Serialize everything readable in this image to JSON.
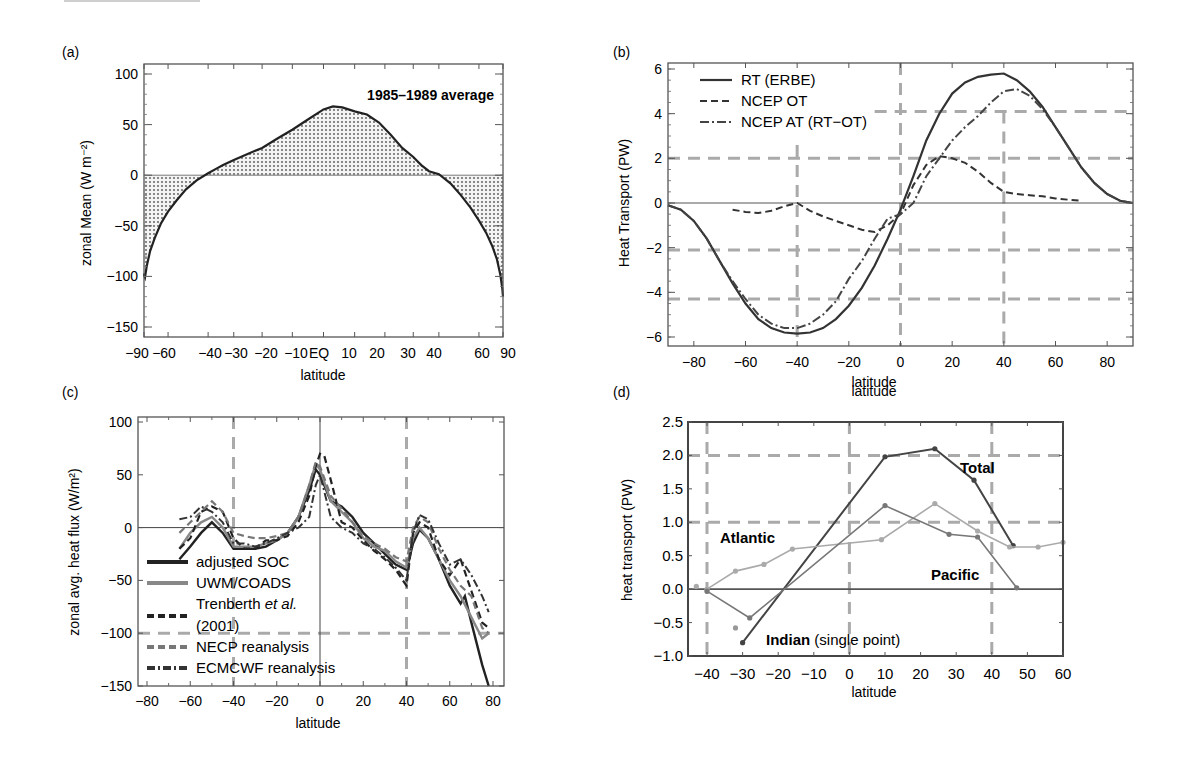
{
  "figure": {
    "panels": [
      "(a)",
      "(b)",
      "(c)",
      "(d)"
    ]
  },
  "chart_data": [
    {
      "id": "a",
      "panel_label": "(a)",
      "type": "area",
      "title": "",
      "annotation": "1985–1989 average",
      "xlabel": "latitude",
      "ylabel": "zonal Mean (W m⁻²)",
      "xlim": [
        -90,
        90
      ],
      "ylim": [
        -150,
        100
      ],
      "xticks": [
        "-90",
        "-60",
        "-40",
        "-30",
        "-20",
        "-10",
        "EQ",
        "10",
        "20",
        "30",
        "40",
        "60",
        "90"
      ],
      "yticks": [
        "100",
        "50",
        "0",
        "-50",
        "-100",
        "-150"
      ],
      "grid": false,
      "fill": "stippled",
      "series": [
        {
          "name": "zonal mean net radiation",
          "x": [
            -90,
            -87,
            -84,
            -80,
            -75,
            -70,
            -65,
            -60,
            -55,
            -50,
            -45,
            -40,
            -37,
            -34,
            -30,
            -25,
            -20,
            -15,
            -10,
            -5,
            0,
            3,
            6,
            10,
            14,
            18,
            22,
            26,
            30,
            33,
            36,
            40,
            45,
            50,
            55,
            60,
            65,
            70,
            75,
            80,
            85,
            90
          ],
          "y": [
            -97,
            -99,
            -101,
            -90,
            -75,
            -62,
            -48,
            -36,
            -25,
            -14,
            -5,
            2,
            6,
            10,
            15,
            21,
            27,
            36,
            45,
            55,
            65,
            68,
            67,
            63,
            60,
            52,
            40,
            27,
            18,
            10,
            4,
            1,
            -8,
            -20,
            -32,
            -45,
            -57,
            -70,
            -83,
            -98,
            -112,
            -120
          ]
        }
      ]
    },
    {
      "id": "b",
      "panel_label": "(b)",
      "type": "line",
      "xlabel": "latitude",
      "ylabel": "Heat Transport (PW)",
      "xlim": [
        -90,
        90
      ],
      "ylim": [
        -6,
        6
      ],
      "xticks": [
        "-80",
        "-60",
        "-40",
        "-20",
        "0",
        "20",
        "40",
        "60",
        "80"
      ],
      "yticks": [
        "6",
        "4",
        "2",
        "0",
        "-2",
        "-4",
        "-6"
      ],
      "grid": "dashed reference lines at y=±2, ±4.2, x=-40, 0, 40",
      "legend_position": "upper left",
      "legend": [
        "RT (ERBE)",
        "NCEP OT",
        "NCEP AT (RT−OT)"
      ],
      "series": [
        {
          "name": "RT (ERBE)",
          "style": "solid",
          "x": [
            -90,
            -85,
            -80,
            -75,
            -70,
            -65,
            -60,
            -55,
            -50,
            -45,
            -40,
            -35,
            -30,
            -25,
            -20,
            -15,
            -10,
            -5,
            0,
            5,
            10,
            15,
            20,
            25,
            30,
            35,
            40,
            45,
            50,
            55,
            60,
            65,
            70,
            75,
            80,
            85,
            90
          ],
          "y": [
            -0.1,
            -0.3,
            -0.8,
            -1.6,
            -2.6,
            -3.6,
            -4.5,
            -5.2,
            -5.6,
            -5.8,
            -5.85,
            -5.8,
            -5.6,
            -5.2,
            -4.6,
            -3.8,
            -2.8,
            -1.6,
            -0.3,
            1.2,
            2.8,
            4.0,
            4.9,
            5.4,
            5.65,
            5.75,
            5.8,
            5.5,
            5.0,
            4.3,
            3.4,
            2.5,
            1.6,
            0.9,
            0.4,
            0.1,
            0.0
          ]
        },
        {
          "name": "NCEP OT",
          "style": "dashed",
          "x": [
            -65,
            -60,
            -55,
            -50,
            -45,
            -40,
            -35,
            -30,
            -25,
            -20,
            -15,
            -10,
            -5,
            0,
            5,
            10,
            15,
            20,
            25,
            30,
            35,
            40,
            45,
            50,
            55,
            60,
            65,
            70
          ],
          "y": [
            -0.3,
            -0.4,
            -0.45,
            -0.35,
            -0.15,
            0.0,
            -0.35,
            -0.6,
            -0.8,
            -1.0,
            -1.2,
            -1.3,
            -1.0,
            -0.5,
            0.8,
            1.7,
            2.1,
            2.0,
            1.8,
            1.4,
            0.9,
            0.5,
            0.4,
            0.35,
            0.3,
            0.2,
            0.15,
            0.1
          ]
        },
        {
          "name": "NCEP AT (RT−OT)",
          "style": "dash-dot",
          "x": [
            -90,
            -85,
            -80,
            -75,
            -70,
            -65,
            -60,
            -55,
            -50,
            -45,
            -40,
            -35,
            -30,
            -25,
            -20,
            -15,
            -10,
            -5,
            0,
            5,
            10,
            15,
            20,
            25,
            30,
            35,
            40,
            45,
            50,
            55,
            60,
            65,
            70,
            75,
            80,
            85,
            90
          ],
          "y": [
            -0.1,
            -0.3,
            -0.8,
            -1.6,
            -2.6,
            -3.5,
            -4.3,
            -5.0,
            -5.4,
            -5.6,
            -5.6,
            -5.4,
            -5.0,
            -4.4,
            -3.4,
            -2.6,
            -1.6,
            -0.7,
            -0.5,
            0.0,
            1.2,
            2.0,
            2.8,
            3.4,
            3.9,
            4.5,
            5.0,
            5.1,
            4.8,
            4.2,
            3.4,
            2.5,
            1.6,
            0.9,
            0.4,
            0.1,
            0.0
          ]
        }
      ]
    },
    {
      "id": "c",
      "panel_label": "(c)",
      "type": "line",
      "xlabel": "latitude",
      "ylabel": "zonal avg. heat flux (W/m²)",
      "xlim": [
        -85,
        85
      ],
      "ylim": [
        -150,
        100
      ],
      "xticks": [
        "-80",
        "-60",
        "-40",
        "-20",
        "0",
        "20",
        "40",
        "60",
        "80"
      ],
      "yticks": [
        "100",
        "50",
        "0",
        "-50",
        "-100",
        "-150"
      ],
      "grid": "dashed reference lines at x=-40, 40 and y=-100; solid at x=0, y=0",
      "legend_position": "lower left",
      "legend": [
        "adjusted SOC",
        "UWM/COADS",
        "Trenberth et al. (2001)",
        "NECP reanalysis",
        "ECMCWF reanalysis"
      ],
      "series": [
        {
          "name": "adjusted SOC",
          "style": "solid black",
          "x": [
            -65,
            -60,
            -55,
            -50,
            -45,
            -40,
            -35,
            -30,
            -25,
            -20,
            -15,
            -10,
            -5,
            -2,
            0,
            5,
            10,
            15,
            20,
            25,
            30,
            35,
            40,
            43,
            46,
            50,
            55,
            60,
            65,
            67,
            70,
            75,
            78
          ],
          "y": [
            -30,
            -18,
            -5,
            5,
            -5,
            -20,
            -20,
            -20,
            -18,
            -12,
            -5,
            10,
            35,
            55,
            50,
            25,
            20,
            10,
            -5,
            -15,
            -25,
            -35,
            -40,
            -15,
            -2,
            -10,
            -30,
            -55,
            -72,
            -65,
            -90,
            -130,
            -150
          ]
        },
        {
          "name": "UWM/COADS",
          "style": "solid gray",
          "x": [
            -65,
            -60,
            -55,
            -50,
            -45,
            -40,
            -35,
            -30,
            -25,
            -20,
            -15,
            -10,
            -5,
            -2,
            0,
            5,
            10,
            15,
            20,
            25,
            30,
            35,
            40,
            43,
            46,
            50,
            55,
            60,
            65,
            70,
            75,
            78
          ],
          "y": [
            -20,
            -5,
            5,
            10,
            0,
            -18,
            -18,
            -18,
            -15,
            -12,
            -5,
            10,
            40,
            60,
            55,
            25,
            15,
            5,
            -10,
            -18,
            -22,
            -32,
            -38,
            -10,
            0,
            -10,
            -30,
            -50,
            -65,
            -85,
            -105,
            -100
          ]
        },
        {
          "name": "Trenberth et al. (2001)",
          "style": "dashed black",
          "x": [
            -65,
            -60,
            -55,
            -50,
            -45,
            -40,
            -35,
            -30,
            -25,
            -20,
            -15,
            -10,
            -5,
            -2,
            0,
            2,
            5,
            10,
            15,
            20,
            25,
            30,
            35,
            40,
            43,
            46,
            50,
            55,
            60,
            65,
            70,
            75,
            78
          ],
          "y": [
            -20,
            -10,
            15,
            20,
            15,
            -10,
            -20,
            -20,
            -12,
            -12,
            -8,
            5,
            30,
            58,
            70,
            68,
            45,
            5,
            0,
            -12,
            -22,
            -30,
            -40,
            -55,
            -5,
            5,
            0,
            -30,
            -45,
            -30,
            -60,
            -90,
            -95
          ]
        },
        {
          "name": "NECP reanalysis",
          "style": "dashed gray",
          "x": [
            -65,
            -60,
            -55,
            -50,
            -45,
            -40,
            -35,
            -30,
            -25,
            -20,
            -15,
            -10,
            -5,
            -2,
            0,
            5,
            10,
            15,
            20,
            25,
            30,
            35,
            40,
            43,
            46,
            50,
            55,
            60,
            65,
            70,
            75,
            78
          ],
          "y": [
            -5,
            5,
            15,
            25,
            15,
            -5,
            -8,
            -10,
            -10,
            -8,
            -5,
            10,
            40,
            62,
            58,
            30,
            18,
            5,
            -8,
            -15,
            -20,
            -28,
            -32,
            0,
            10,
            5,
            -20,
            -40,
            -55,
            -65,
            -95,
            -100
          ]
        },
        {
          "name": "ECMCWF reanalysis",
          "style": "dash-dot black",
          "x": [
            -65,
            -60,
            -55,
            -50,
            -45,
            -40,
            -35,
            -30,
            -25,
            -20,
            -15,
            -10,
            -5,
            -2,
            0,
            5,
            10,
            15,
            20,
            25,
            30,
            35,
            40,
            43,
            46,
            50,
            55,
            60,
            65,
            70,
            75,
            78
          ],
          "y": [
            8,
            10,
            20,
            15,
            5,
            -15,
            -15,
            -18,
            -15,
            -10,
            -5,
            0,
            10,
            40,
            50,
            10,
            0,
            -5,
            -15,
            -20,
            -28,
            -38,
            -50,
            -5,
            12,
            8,
            -15,
            -35,
            -30,
            -45,
            -65,
            -80
          ]
        }
      ]
    },
    {
      "id": "d",
      "panel_label": "(d)",
      "type": "line",
      "xlabel": "latitude",
      "top_label": "latitude",
      "ylabel": "heat transport (PW)",
      "xlim": [
        -45,
        60
      ],
      "ylim": [
        -1.0,
        2.5
      ],
      "xticks": [
        "-40",
        "-30",
        "-20",
        "-10",
        "0",
        "10",
        "20",
        "30",
        "40",
        "50",
        "60"
      ],
      "yticks": [
        "2.5",
        "2.0",
        "1.5",
        "1.0",
        "0.5",
        "0.0",
        "-0.5",
        "-1.0"
      ],
      "grid": "dashed reference lines at x=-40, 0, 40 and y=1.0, 2.0",
      "annotations": [
        "Total",
        "Atlantic",
        "Pacific",
        "Indian (single point)"
      ],
      "series": [
        {
          "name": "Total",
          "style": "dark line with markers",
          "x": [
            -30,
            10,
            24,
            35,
            46
          ],
          "y": [
            -0.8,
            1.98,
            2.1,
            1.63,
            0.65
          ]
        },
        {
          "name": "Atlantic",
          "style": "light gray line with markers",
          "x": [
            -40,
            -32,
            -24,
            -16,
            9,
            24,
            36,
            45,
            53,
            60
          ],
          "y": [
            0.0,
            0.27,
            0.37,
            0.6,
            0.74,
            1.28,
            0.87,
            0.63,
            0.63,
            0.7
          ],
          "extra_points": [
            {
              "x": -43,
              "y": 0.04
            }
          ]
        },
        {
          "name": "Pacific",
          "style": "medium gray line with markers",
          "x": [
            -40,
            -28,
            10,
            28,
            36,
            47
          ],
          "y": [
            -0.03,
            -0.43,
            1.25,
            0.82,
            0.78,
            0.02
          ]
        },
        {
          "name": "Indian (single point)",
          "style": "single marker",
          "x": [
            -32
          ],
          "y": [
            -0.58
          ]
        }
      ]
    }
  ]
}
